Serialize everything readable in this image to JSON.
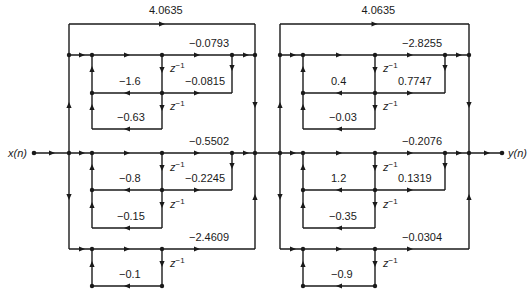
{
  "diagram": {
    "type": "signal-flow-graph",
    "input_label": "x(n)",
    "output_label": "y(n)",
    "delay_label": "z",
    "delay_exp": "−1",
    "stage1": {
      "direct_gain": "4.0635",
      "section_a": {
        "b1": "−0.0793",
        "b2": "−0.0815",
        "a1": "−1.6",
        "a2": "−0.63"
      },
      "section_b": {
        "b1": "−0.5502",
        "b2": "−0.2245",
        "a1": "−0.8",
        "a2": "−0.15"
      },
      "section_c": {
        "b1": "−2.4609",
        "a1": "−0.1"
      }
    },
    "stage2": {
      "direct_gain": "4.0635",
      "section_a": {
        "b1": "−2.8255",
        "b2": "0.7747",
        "a1": "0.4",
        "a2": "−0.03"
      },
      "section_b": {
        "b1": "−0.2076",
        "b2": "0.1319",
        "a1": "1.2",
        "a2": "−0.35"
      },
      "section_c": {
        "b1": "−0.0304",
        "a1": "−0.9"
      }
    }
  }
}
